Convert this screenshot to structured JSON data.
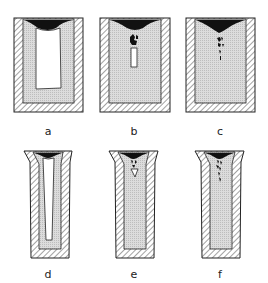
{
  "figure": {
    "panels": [
      {
        "id": "a",
        "label": "a",
        "mold": "straight",
        "defect": "open-pipe"
      },
      {
        "id": "b",
        "label": "b",
        "mold": "straight",
        "defect": "secondary-pipe"
      },
      {
        "id": "c",
        "label": "c",
        "mold": "straight",
        "defect": "porosity"
      },
      {
        "id": "d",
        "label": "d",
        "mold": "flared",
        "defect": "open-pipe"
      },
      {
        "id": "e",
        "label": "e",
        "mold": "flared",
        "defect": "secondary-pipe"
      },
      {
        "id": "f",
        "label": "f",
        "mold": "flared",
        "defect": "porosity"
      }
    ],
    "colors": {
      "outline": "#222222",
      "shrinkage": "#111111",
      "metal": "#d8d8d8",
      "hatch": "#555555",
      "background": "#ffffff"
    }
  }
}
